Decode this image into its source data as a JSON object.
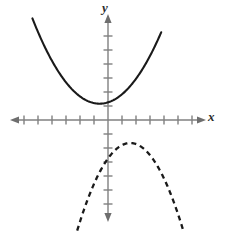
{
  "figure": {
    "background_color": "#ffffff",
    "width": 225,
    "height": 234
  },
  "axes": {
    "x_label": "x",
    "y_label": "y",
    "axis_color": "#808080",
    "origin_px": [
      108,
      120
    ],
    "tick_spacing_px": 14,
    "tick_length_px": 9,
    "x_axis_ticks_left": 7,
    "x_axis_ticks_right": 6,
    "y_axis_ticks_up": 6,
    "y_axis_ticks_down": 5,
    "x_axis_start_px": 11,
    "x_axis_end_px": 205,
    "y_axis_start_px": 14,
    "y_axis_end_px": 222,
    "arrowheads": [
      "left",
      "right",
      "up",
      "down"
    ]
  },
  "chart_data": {
    "type": "line",
    "title": "",
    "xlabel": "x",
    "ylabel": "y",
    "grid": false,
    "legend": null,
    "xlim": [
      -7.5,
      7
    ],
    "ylim": [
      -7.5,
      8
    ],
    "axis_tick_step": 1,
    "series": [
      {
        "name": "solid-parabola",
        "style": "solid",
        "color": "#1a1a1a",
        "line_width": 2.1,
        "direction": "opens-upward",
        "vertex": [
          -0.8,
          1.2
        ],
        "x": [
          -5.4,
          -4.5,
          -3.6,
          -2.7,
          -1.8,
          -0.8,
          0.2,
          1.1,
          2.0,
          2.9,
          3.8
        ],
        "y": [
          7.2,
          5.2,
          3.6,
          2.4,
          1.5,
          1.2,
          1.3,
          1.9,
          2.9,
          4.4,
          6.3
        ],
        "equation_form": "y = a(x - h)^2 + k, a > 0"
      },
      {
        "name": "dashed-parabola",
        "style": "dashed",
        "color": "#1a1a1a",
        "line_width": 2.3,
        "dash_pattern": "5 4",
        "direction": "opens-downward",
        "vertex": [
          1.6,
          -1.3
        ],
        "x": [
          -2.2,
          -1.4,
          -0.6,
          0.2,
          0.9,
          1.6,
          2.3,
          3.1,
          3.9,
          4.6,
          5.4
        ],
        "y": [
          -7.7,
          -5.7,
          -4.0,
          -2.6,
          -1.7,
          -1.3,
          -1.7,
          -2.7,
          -4.2,
          -5.9,
          -7.7
        ],
        "equation_form": "y = a(x - h)^2 + k, a < 0"
      }
    ]
  }
}
